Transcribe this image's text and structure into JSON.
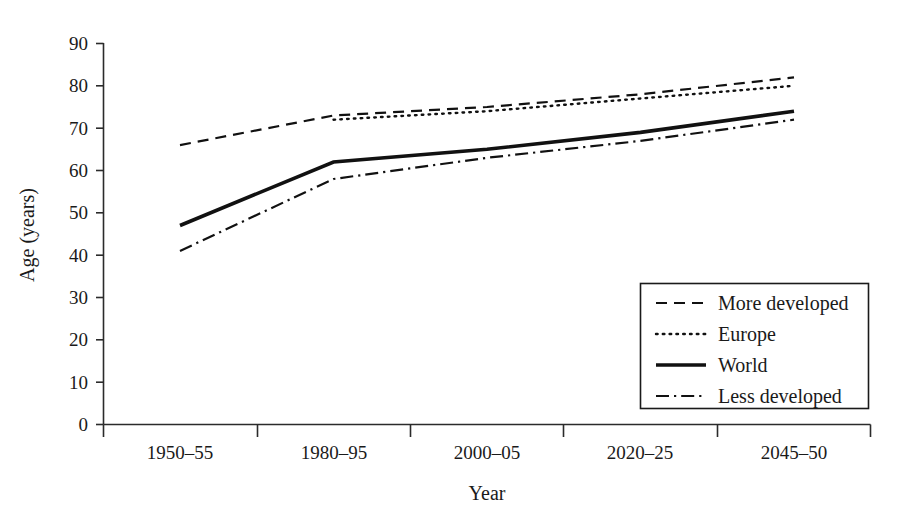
{
  "chart_data": {
    "type": "line",
    "title": "",
    "xlabel": "Year",
    "ylabel": "Age (years)",
    "categories": [
      "1950–55",
      "1980–95",
      "2000–05",
      "2020–25",
      "2045–50"
    ],
    "x_tick_labels": [
      "1950–55",
      "1980–95",
      "2000–05",
      "2020–25",
      "2045–50"
    ],
    "y_tick_labels": [
      "0",
      "10",
      "20",
      "30",
      "40",
      "50",
      "60",
      "70",
      "80",
      "90"
    ],
    "y_ticks": [
      0,
      10,
      20,
      30,
      40,
      50,
      60,
      70,
      80,
      90
    ],
    "ylim": [
      0,
      90
    ],
    "grid": false,
    "legend_position": "bottom-right",
    "series": [
      {
        "name": "More developed",
        "style": "dashed",
        "color": "#111111",
        "values": [
          66,
          73,
          75,
          78,
          82
        ]
      },
      {
        "name": "Europe",
        "style": "dotted",
        "color": "#111111",
        "values": [
          null,
          72,
          74,
          77,
          80
        ]
      },
      {
        "name": "World",
        "style": "solid",
        "color": "#111111",
        "values": [
          47,
          62,
          65,
          69,
          74
        ]
      },
      {
        "name": "Less developed",
        "style": "dash-dot",
        "color": "#111111",
        "values": [
          41,
          58,
          63,
          67,
          72
        ]
      }
    ]
  },
  "legend": {
    "items": [
      {
        "label": "More developed",
        "style": "dashed"
      },
      {
        "label": "Europe",
        "style": "dotted"
      },
      {
        "label": "World",
        "style": "solid"
      },
      {
        "label": "Less developed",
        "style": "dash-dot"
      }
    ]
  }
}
